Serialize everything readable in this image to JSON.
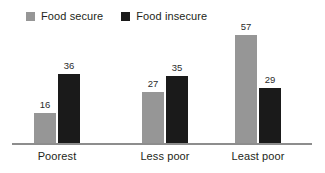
{
  "chart_data": {
    "type": "bar",
    "title": "",
    "subtitle": "",
    "xlabel": "",
    "ylabel": "",
    "categories": [
      "Poorest",
      "Less poor",
      "Least poor"
    ],
    "series": [
      {
        "name": "Food secure",
        "color": "#969696",
        "values": [
          16,
          27,
          57
        ]
      },
      {
        "name": "Food insecure",
        "color": "#1a1a1a",
        "values": [
          36,
          35,
          29
        ]
      }
    ],
    "ylim": [
      0,
      62
    ],
    "grid": false,
    "legend_position": "top-left",
    "data_labels": true,
    "axis_color": "#8d8d8d"
  },
  "legend": {
    "items": [
      {
        "label": "Food secure",
        "swatch": "legend-swatch-food-secure"
      },
      {
        "label": "Food insecure",
        "swatch": "legend-swatch-food-insecure"
      }
    ]
  }
}
